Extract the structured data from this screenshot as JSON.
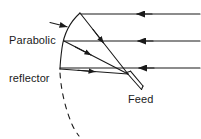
{
  "figure": {
    "width": 201,
    "height": 139,
    "background_color": "#ffffff",
    "stroke_color": "#1a1a1a"
  },
  "labels": {
    "reflector": "Parabolic\nreflector",
    "reflector_line1": "Parabolic",
    "reflector_line2": "reflector",
    "feed": "Feed"
  },
  "diagram_data": {
    "type": "ray-diagram",
    "components": [
      {
        "name": "parabolic-reflector",
        "kind": "curve",
        "style": "solid",
        "points": [
          [
            80,
            13
          ],
          [
            68,
            28
          ],
          [
            63,
            45
          ],
          [
            60,
            69
          ]
        ]
      },
      {
        "name": "reflector-dashed-extension",
        "kind": "curve",
        "style": "dashed",
        "points": [
          [
            60,
            72
          ],
          [
            63,
            95
          ],
          [
            70,
            116
          ],
          [
            79,
            135
          ]
        ]
      },
      {
        "name": "feed-horn",
        "kind": "waveguide",
        "focus": [
          128,
          74
        ],
        "tip": [
          141,
          89
        ]
      }
    ],
    "focus_point": [
      128,
      74
    ],
    "incoming_rays": [
      {
        "name": "incoming-ray-top",
        "y": 14,
        "from_x": 200,
        "to_x": 80,
        "arrow_x": 137
      },
      {
        "name": "incoming-ray-middle",
        "y": 41,
        "from_x": 200,
        "to_x": 64,
        "arrow_x": 138
      },
      {
        "name": "incoming-ray-bottom",
        "y": 68,
        "from_x": 200,
        "to_x": 60,
        "arrow_x": 139
      }
    ],
    "reflected_rays": [
      {
        "name": "reflected-ray-top",
        "from": [
          80,
          13
        ],
        "to": [
          128,
          74
        ],
        "arrow_at": 0.45
      },
      {
        "name": "reflected-ray-middle",
        "from": [
          64,
          41
        ],
        "to": [
          128,
          74
        ],
        "arrow_at": 0.45
      },
      {
        "name": "reflected-ray-bottom",
        "from": [
          60,
          69
        ],
        "to": [
          128,
          74
        ],
        "arrow_at": 0.5
      }
    ],
    "leader_line": {
      "name": "reflector-leader",
      "from": [
        50,
        23
      ],
      "to": [
        68,
        27
      ]
    }
  }
}
